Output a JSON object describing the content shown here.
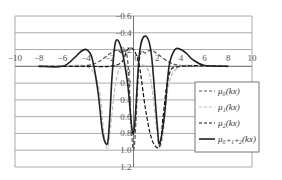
{
  "chart_data": {
    "type": "line",
    "title": "",
    "xlabel": "",
    "ylabel": "",
    "xlim": [
      -10,
      10
    ],
    "ylim": [
      1.2,
      -0.6
    ],
    "y_inverted": true,
    "grid": true,
    "legend_position": "lower right inside",
    "x_ticks": [
      "-10",
      "-8",
      "-6",
      "-4",
      "-2",
      "0",
      "2",
      "4",
      "6",
      "8",
      "10"
    ],
    "y_ticks": [
      "-0.6",
      "-0.4",
      "-0.2",
      "0",
      "0.2",
      "0.4",
      "0.6",
      "0.8",
      "1.0",
      "1.2"
    ],
    "series": [
      {
        "name": "μ0(kx)",
        "legend_label": "μ₀(kx)",
        "style": "dashed",
        "color": "#555555",
        "x": [
          -8,
          -6,
          -4,
          -3,
          -2,
          -1.5,
          -1,
          -0.5,
          0,
          0.5,
          1,
          1.5,
          2,
          3,
          4,
          6,
          8
        ],
        "y": [
          0,
          0,
          -0.01,
          -0.05,
          -0.15,
          -0.19,
          -0.16,
          -0.08,
          1.0,
          -0.08,
          -0.16,
          -0.19,
          -0.15,
          -0.05,
          -0.01,
          0,
          0
        ]
      },
      {
        "name": "μ1(kx)",
        "legend_label": "μ₁(kx)",
        "style": "dashed",
        "color": "#bbbbbb",
        "x": [
          -8,
          -6,
          -4,
          -3,
          -2.5,
          -2.2,
          -2,
          -1.5,
          -1,
          0,
          1,
          1.5,
          2,
          2.2,
          2.5,
          3,
          4,
          6,
          8
        ],
        "y": [
          0,
          0,
          0,
          0.2,
          0.8,
          0.98,
          0.8,
          0.2,
          0,
          0,
          0,
          0.2,
          0.8,
          0.98,
          0.8,
          0.2,
          0,
          0,
          0
        ]
      },
      {
        "name": "μ2(kx)",
        "legend_label": "μ₂(kx)",
        "style": "dashed",
        "color": "#111111",
        "x": [
          -8,
          -4,
          -2,
          -1,
          -0.5,
          0,
          0.5,
          1,
          1.5,
          2,
          2.3,
          2.5,
          3,
          4,
          8
        ],
        "y": [
          0,
          0,
          0,
          -0.05,
          -0.2,
          -0.2,
          0,
          0.5,
          0.85,
          0.97,
          0.9,
          0.6,
          0.1,
          0,
          0
        ]
      },
      {
        "name": "μ0+1+2(kx)",
        "legend_label": "μ₀₊₁₊₂(kx)",
        "style": "solid",
        "color": "#222222",
        "x": [
          -8,
          -6,
          -5,
          -4.5,
          -4,
          -3.5,
          -3,
          -2.6,
          -2.2,
          -2,
          -1.8,
          -1.5,
          -1,
          -0.5,
          0,
          0.5,
          1,
          1.5,
          2,
          2.2,
          2.6,
          3,
          3.5,
          4,
          4.5,
          5,
          6,
          8
        ],
        "y": [
          0,
          0,
          -0.1,
          -0.17,
          -0.2,
          -0.1,
          0.3,
          0.8,
          0.92,
          0.6,
          0.1,
          -0.3,
          -0.2,
          0.2,
          0.8,
          -0.15,
          -0.36,
          -0.15,
          0.7,
          0.92,
          0.6,
          0.0,
          -0.2,
          -0.2,
          -0.15,
          -0.08,
          -0.01,
          0
        ]
      }
    ]
  }
}
